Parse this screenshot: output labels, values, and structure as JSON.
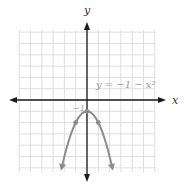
{
  "chart_data": {
    "type": "line",
    "title": "",
    "xlabel": "x",
    "ylabel": "y",
    "equation_label": "y = −1 − x²",
    "annotations": [
      {
        "text": "−1",
        "x": 0,
        "y": -1
      }
    ],
    "xlim": [
      -6,
      6
    ],
    "ylim": [
      -6.4,
      6.2
    ],
    "grid": true,
    "series": [
      {
        "name": "y = −1 − x²",
        "x": [
          -2.3,
          -2,
          -1.5,
          -1,
          -0.5,
          0,
          0.5,
          1,
          1.5,
          2,
          2.3
        ],
        "y": [
          -6.29,
          -5,
          -3.25,
          -2,
          -1.25,
          -1,
          -1.25,
          -2,
          -3.25,
          -5,
          -6.29
        ],
        "marked_points": [
          {
            "x": -1,
            "y": -2
          },
          {
            "x": 0,
            "y": -1
          },
          {
            "x": 1,
            "y": -2
          }
        ],
        "color": "#8c8c8c",
        "arrows_at_ends": true
      }
    ]
  },
  "labels": {
    "x_axis": "x",
    "y_axis": "y",
    "equation": "y = −1 − x²",
    "vertex_value": "−1"
  },
  "colors": {
    "grid": "#d6d6d6",
    "axis": "#1a1a1a",
    "curve": "#8c8c8c",
    "label_gray": "#9a9a9a"
  }
}
